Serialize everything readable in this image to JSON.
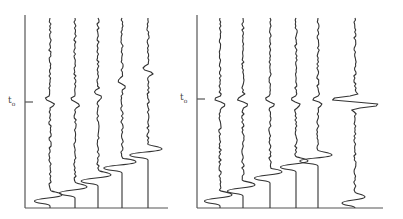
{
  "panels": [
    {
      "id": "left",
      "t0_label": "t",
      "t0_sub": "o",
      "t0_y": 102,
      "axis": {
        "x": 25,
        "top": 15,
        "bottom": 208,
        "right": 168
      },
      "traces": [
        {
          "x": 50,
          "event_y": 102,
          "event_amp": 6,
          "bottom_y": 198,
          "bottom_amp": 12
        },
        {
          "x": 75,
          "event_y": 102,
          "event_amp": 5,
          "bottom_y": 190,
          "bottom_amp": 12
        },
        {
          "x": 98,
          "event_y": 95,
          "event_amp": 5,
          "bottom_y": 178,
          "bottom_amp": 13
        },
        {
          "x": 122,
          "event_y": 84,
          "event_amp": 5,
          "bottom_y": 165,
          "bottom_amp": 14
        },
        {
          "x": 148,
          "event_y": 71,
          "event_amp": 5,
          "bottom_y": 152,
          "bottom_amp": 14
        }
      ]
    },
    {
      "id": "right",
      "t0_label": "t",
      "t0_sub": "o",
      "t0_y": 99,
      "axis": {
        "x": 197,
        "top": 15,
        "bottom": 208,
        "right": 383
      },
      "traces": [
        {
          "x": 220,
          "event_y": 102,
          "event_amp": 6,
          "bottom_y": 198,
          "bottom_amp": 12
        },
        {
          "x": 243,
          "event_y": 102,
          "event_amp": 6,
          "bottom_y": 188,
          "bottom_amp": 12
        },
        {
          "x": 270,
          "event_y": 102,
          "event_amp": 6,
          "bottom_y": 175,
          "bottom_amp": 12
        },
        {
          "x": 296,
          "event_y": 102,
          "event_amp": 6,
          "bottom_y": 164,
          "bottom_amp": 12
        },
        {
          "x": 318,
          "event_y": 102,
          "event_amp": 6,
          "bottom_y": 158,
          "bottom_amp": 14
        },
        {
          "x": 355,
          "event_y": 102,
          "event_amp": 32,
          "bottom_y": 200,
          "bottom_amp": 10
        }
      ]
    }
  ]
}
